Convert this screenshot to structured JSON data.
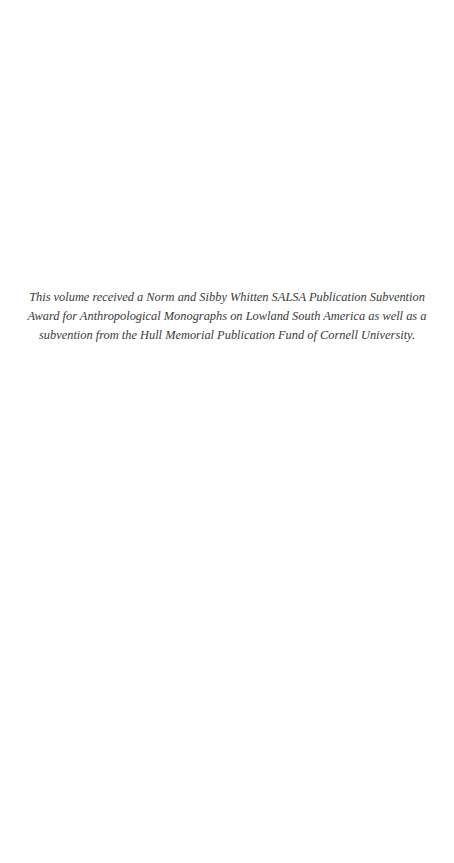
{
  "page": {
    "subvention_note": {
      "lines": [
        "This volume received a Norm and Sibby Whitten SALSA Publication Subvention",
        "Award for Anthropological Monographs on Lowland South America as well as a",
        "subvention from the Hull Memorial Publication Fund of Cornell University."
      ]
    }
  }
}
